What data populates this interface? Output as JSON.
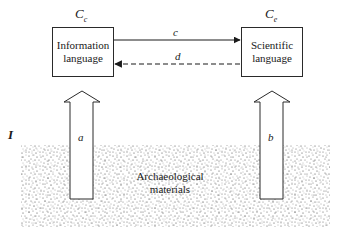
{
  "diagram": {
    "nodes": {
      "left_box": {
        "label_line1": "Information",
        "label_line2": "language",
        "corner_label": "C",
        "corner_sub": "c"
      },
      "right_box": {
        "label_line1": "Scientific",
        "label_line2": "language",
        "corner_label": "C",
        "corner_sub": "e"
      },
      "materials": {
        "label_line1": "Archaeological",
        "label_line2": "materials"
      }
    },
    "edges": [
      {
        "id": "c",
        "label": "c",
        "from": "Information language",
        "to": "Scientific language",
        "style": "solid"
      },
      {
        "id": "d",
        "label": "d",
        "from": "Scientific language",
        "to": "Information language",
        "style": "dashed"
      },
      {
        "id": "a",
        "label": "a",
        "from": "Archaeological materials",
        "to": "Information language",
        "style": "hollow-block-arrow"
      },
      {
        "id": "b",
        "label": "b",
        "from": "Archaeological materials",
        "to": "Scientific language",
        "style": "hollow-block-arrow"
      }
    ],
    "level_label": "I",
    "colors": {
      "ink": "#1a1a1a",
      "stipple": "#555555",
      "background": "#ffffff"
    }
  }
}
